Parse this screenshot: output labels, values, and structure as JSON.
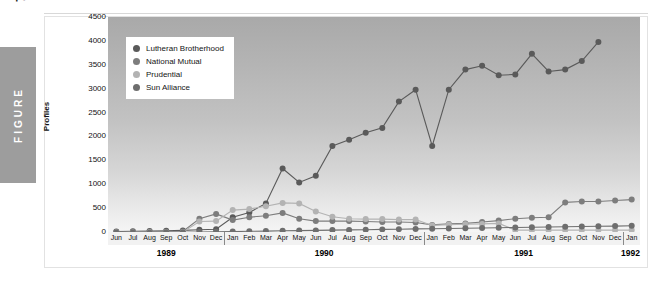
{
  "figure": {
    "tab_label": "FIGURE",
    "number": "7"
  },
  "chart_data": {
    "type": "line",
    "title": "",
    "xlabel": "",
    "ylabel": "Profiles",
    "ylim": [
      0,
      4500
    ],
    "yticks": [
      4500,
      4000,
      3500,
      3000,
      2500,
      2000,
      1500,
      1000,
      500,
      0
    ],
    "grid": false,
    "legend_position": "top-left",
    "x": [
      "Jun",
      "Jul",
      "Aug",
      "Sep",
      "Oct",
      "Nov",
      "Dec",
      "Jan",
      "Feb",
      "Mar",
      "Apr",
      "May",
      "Jun",
      "Jul",
      "Aug",
      "Sep",
      "Oct",
      "Nov",
      "Dec",
      "Jan",
      "Feb",
      "Mar",
      "Apr",
      "May",
      "Jun",
      "Jul",
      "Aug",
      "Sep",
      "Oct",
      "Nov",
      "Dec",
      "Jan"
    ],
    "year_groups": [
      {
        "label": "1989",
        "start_index": 0,
        "end_index": 6
      },
      {
        "label": "1990",
        "start_index": 7,
        "end_index": 18
      },
      {
        "label": "1991",
        "start_index": 19,
        "end_index": 30
      },
      {
        "label": "1992",
        "start_index": 31,
        "end_index": 31
      }
    ],
    "series": [
      {
        "name": "Lutheran Brotherhood",
        "color": "#5a5a5a",
        "values": [
          30,
          35,
          40,
          45,
          55,
          70,
          80,
          330,
          430,
          620,
          1350,
          1060,
          1200,
          1820,
          1950,
          2100,
          2200,
          2750,
          3000,
          1820,
          3000,
          3420,
          3500,
          3300,
          3320,
          3750,
          3380,
          3420,
          3600,
          4000,
          null,
          null
        ]
      },
      {
        "name": "National Mutual",
        "color": "#7d7d7d",
        "values": [
          20,
          22,
          25,
          28,
          32,
          300,
          400,
          270,
          330,
          360,
          420,
          300,
          250,
          250,
          250,
          240,
          230,
          230,
          220,
          170,
          190,
          200,
          230,
          260,
          300,
          320,
          330,
          640,
          660,
          660,
          680,
          700
        ]
      },
      {
        "name": "Prudential",
        "color": "#b3b3b3",
        "values": [
          10,
          12,
          14,
          16,
          18,
          240,
          250,
          480,
          500,
          560,
          630,
          620,
          450,
          340,
          300,
          290,
          290,
          280,
          280,
          160,
          175,
          185,
          190,
          200,
          60,
          60,
          60,
          60,
          60,
          60,
          60,
          60
        ]
      },
      {
        "name": "Sun Alliance",
        "color": "#6e6e6e",
        "values": [
          8,
          10,
          12,
          14,
          16,
          20,
          25,
          30,
          35,
          40,
          45,
          50,
          55,
          60,
          65,
          70,
          75,
          80,
          85,
          90,
          95,
          100,
          105,
          110,
          115,
          120,
          125,
          130,
          135,
          140,
          145,
          150
        ]
      }
    ]
  },
  "legend": [
    {
      "label": "Lutheran Brotherhood",
      "color": "#5a5a5a"
    },
    {
      "label": "National Mutual",
      "color": "#7d7d7d"
    },
    {
      "label": "Prudential",
      "color": "#b3b3b3"
    },
    {
      "label": "Sun Alliance",
      "color": "#6e6e6e"
    }
  ]
}
